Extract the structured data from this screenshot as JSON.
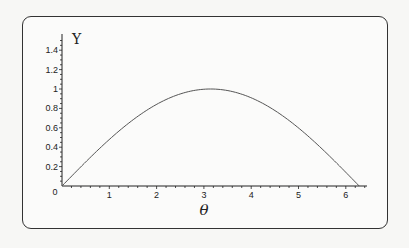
{
  "chart_data": {
    "type": "line",
    "title": "",
    "xlabel": "θ",
    "ylabel": "Υ",
    "xlim": [
      0,
      6.5
    ],
    "ylim": [
      0,
      1.55
    ],
    "x_ticks": [
      "0",
      "1",
      "2",
      "3",
      "4",
      "5",
      "6"
    ],
    "y_ticks": [
      "0.2",
      "0.4",
      "0.6",
      "0.8",
      "1",
      "1.2",
      "1.4"
    ],
    "grid": false,
    "legend": null,
    "series": [
      {
        "name": "Υ(θ)",
        "x": [
          0,
          0.5,
          1,
          1.5,
          2,
          2.5,
          3,
          3.14159,
          3.5,
          4,
          4.5,
          5,
          5.5,
          6,
          6.28318
        ],
        "values": [
          0,
          0.247,
          0.479,
          0.682,
          0.841,
          0.949,
          0.997,
          1.0,
          0.984,
          0.909,
          0.778,
          0.598,
          0.381,
          0.141,
          0
        ]
      }
    ]
  },
  "axes": {
    "origin_label": "0",
    "x_tick_labels": [
      "1",
      "2",
      "3",
      "4",
      "5",
      "6"
    ],
    "y_tick_labels": [
      "0.2",
      "0.4",
      "0.6",
      "0.8",
      "1",
      "1.2",
      "1.4"
    ],
    "x_title": "θ",
    "y_title": "Υ"
  },
  "colors": {
    "curve": "#555555",
    "axis": "#222222",
    "frame": "#333333"
  }
}
